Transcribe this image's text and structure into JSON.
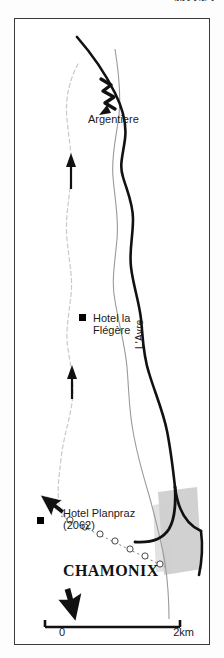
{
  "page": {
    "header_fragment": "MONT",
    "background_color": "#fdfdfd"
  },
  "map": {
    "title_place": "CHAMONIX",
    "frame_color": "#3a3a3a",
    "labels": [
      {
        "id": "argentiere",
        "text": "Argentiere",
        "kind": "settlement"
      },
      {
        "id": "hotel-flegere",
        "text": "Hotel la\nFlégère",
        "line1": "Hotel la",
        "line2": "Flégère",
        "kind": "hotel"
      },
      {
        "id": "hotel-planpraz",
        "text": "Hotel Planpraz\n(2062)",
        "line1": "Hotel Planpraz",
        "line2": "(2062)",
        "kind": "hotel",
        "elevation_m": 2062
      },
      {
        "id": "lavre",
        "text": "L'Avre",
        "kind": "river"
      },
      {
        "id": "chamonix",
        "text": "CHAMONIX",
        "kind": "town"
      }
    ],
    "features": {
      "road_color": "#111111",
      "river_color": "#8c8c8c",
      "trail_color": "#c9c9c9",
      "urban_fill": "#cfcfcf",
      "marker_color": "#000000"
    },
    "markers": [
      {
        "id": "marker-flegere",
        "label": "Hotel la Flégère"
      },
      {
        "id": "marker-planpraz",
        "label": "Hotel Planpraz"
      }
    ],
    "cursors": [
      {
        "id": "cursor-planpraz",
        "direction": "up-left"
      },
      {
        "id": "cursor-compass",
        "direction": "down-left"
      }
    ],
    "direction_arrows": [
      {
        "id": "arrow-north-upper",
        "direction": "up"
      },
      {
        "id": "arrow-north-lower",
        "direction": "up"
      }
    ]
  },
  "scale": {
    "min_label": "0",
    "max_label": "2km",
    "distance_km": 2
  }
}
